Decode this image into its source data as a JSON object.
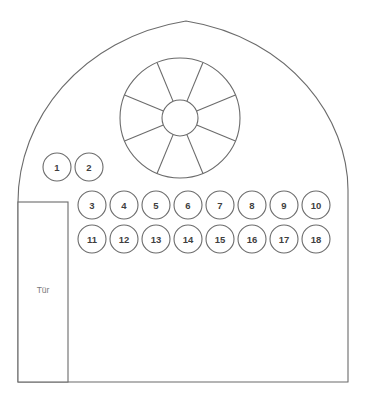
{
  "diagram": {
    "type": "floor-plan",
    "stroke_color": "#6b6b6b",
    "label_color": "#3f3f3f",
    "muted_label_color": "#7a7a7a",
    "background_color": "#ffffff"
  },
  "building": {
    "shape_name": "arched-gable-outline",
    "apex_x": 186,
    "apex_y": 21,
    "base_y": 382,
    "left_base_x": 18,
    "right_base_x": 348
  },
  "door": {
    "label": "Tür",
    "label_x": 42,
    "label_y": 290,
    "x": 18,
    "y": 202,
    "width": 50,
    "height": 180
  },
  "rose_window": {
    "name": "rose-window",
    "center_x": 180,
    "center_y": 118,
    "outer_radius": 60,
    "inner_radius": 18,
    "spoke_count": 8,
    "spoke_start_angle_deg": 22.5
  },
  "seat_rows": [
    {
      "row_name": "row-1",
      "start_x": 57,
      "y": 167,
      "spacing": 32,
      "radius": 14,
      "seats": [
        "1",
        "2"
      ]
    },
    {
      "row_name": "row-2",
      "start_x": 92,
      "y": 205,
      "spacing": 32,
      "radius": 14,
      "seats": [
        "3",
        "4",
        "5",
        "6",
        "7",
        "8",
        "9",
        "10"
      ]
    },
    {
      "row_name": "row-3",
      "start_x": 92,
      "y": 239,
      "spacing": 32,
      "radius": 14,
      "seats": [
        "11",
        "12",
        "13",
        "14",
        "15",
        "16",
        "17",
        "18"
      ]
    }
  ]
}
